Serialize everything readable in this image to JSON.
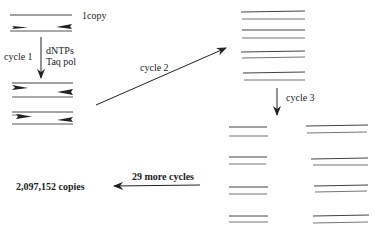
{
  "diagram": {
    "labels": {
      "initial_copy": "1copy",
      "cycle1": "cycle 1",
      "reagents_line1": "dNTPs",
      "reagents_line2": "Taq pol",
      "cycle2": "cycle 2",
      "cycle3": "cycle 3",
      "more_cycles": "29 more cycles",
      "result": "2,097,152 copies"
    },
    "stages": [
      {
        "name": "initial",
        "duplexes": 1,
        "primers_shown": true
      },
      {
        "name": "after-cycle-1",
        "duplexes": 2,
        "primers_shown": true
      },
      {
        "name": "after-cycle-2",
        "duplexes": 4,
        "primers_shown": false
      },
      {
        "name": "after-cycle-3",
        "duplexes": 8,
        "primers_shown": false
      }
    ],
    "colors": {
      "line": "#333333",
      "background": "#ffffff"
    }
  }
}
